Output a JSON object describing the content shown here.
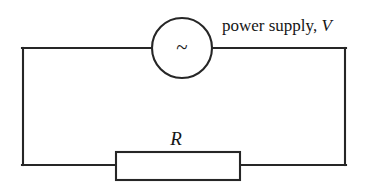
{
  "diagram": {
    "type": "electrical-circuit-schematic",
    "background_color": "#ffffff",
    "line_color": "#262626",
    "text_color": "#161616",
    "power_supply": {
      "symbol": "~",
      "symbol_name": "ac-source-tilde",
      "label_prefix": "power supply, ",
      "label_variable": "V",
      "full_label": "power supply, V",
      "center_x": 182,
      "center_y": 48,
      "radius": 30
    },
    "resistor": {
      "label": "R",
      "label_x": 176,
      "label_y": 139,
      "box_x": 116,
      "box_y": 152,
      "box_width": 124,
      "box_height": 28
    },
    "wires": {
      "top_y": 48,
      "bottom_y": 165,
      "left_x": 23,
      "right_x": 345,
      "top_left_segment": "23,48 to 152,48",
      "top_right_segment": "212,48 to 345,48",
      "bottom_left_segment": "23,165 to 116,165",
      "bottom_right_segment": "240,165 to 345,165",
      "left_vertical": "23,48 to 23,165",
      "right_vertical": "345,48 to 345,165"
    }
  }
}
